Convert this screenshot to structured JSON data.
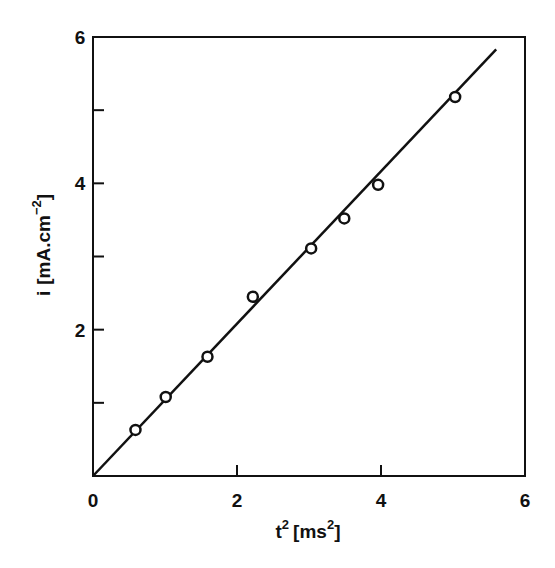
{
  "chart_data": {
    "type": "scatter",
    "title": "",
    "xlabel": "t² [ms²]",
    "ylabel": "i [mA.cm⁻²]",
    "xlabel_parts": {
      "base": "t",
      "base_sup": "2",
      "unit_open": "[ms",
      "unit_sup": "2",
      "unit_close": "]"
    },
    "ylabel_parts": {
      "base": "i",
      "unit_open": "[mA.cm",
      "unit_sup": "−2",
      "unit_close": "]"
    },
    "xlim": [
      0,
      6
    ],
    "ylim": [
      0,
      6
    ],
    "x_ticks": [
      0,
      2,
      4,
      6
    ],
    "x_tick_labels": [
      "0",
      "2",
      "4",
      "6"
    ],
    "y_ticks": [
      1,
      2,
      3,
      4,
      5,
      6
    ],
    "y_tick_labels": [
      "",
      "2",
      "",
      "4",
      "",
      "6"
    ],
    "grid": false,
    "legend": null,
    "series": [
      {
        "name": "measured",
        "marker": "open-circle",
        "x": [
          0.59,
          1.01,
          1.59,
          2.22,
          3.03,
          3.49,
          3.96,
          5.03
        ],
        "y": [
          0.63,
          1.08,
          1.63,
          2.45,
          3.11,
          3.52,
          3.98,
          5.18
        ]
      },
      {
        "name": "linear fit",
        "style": "line",
        "x": [
          0,
          5.6
        ],
        "y": [
          0,
          5.83
        ]
      }
    ],
    "colors": {
      "ink": "#111111",
      "background": "#ffffff"
    }
  }
}
